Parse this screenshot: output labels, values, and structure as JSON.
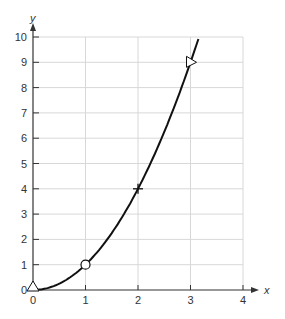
{
  "chart_data": {
    "type": "line",
    "title": "",
    "xlabel": "x",
    "ylabel": "y",
    "xlim": [
      0,
      4
    ],
    "ylim": [
      0,
      10
    ],
    "grid": true,
    "x_ticks": [
      "0",
      "1",
      "2",
      "3",
      "4"
    ],
    "y_ticks": [
      "0",
      "1",
      "2",
      "3",
      "4",
      "5",
      "6",
      "7",
      "8",
      "9",
      "10"
    ],
    "series": [
      {
        "name": "y = x^2",
        "function": "x^2",
        "x": [
          0,
          0.5,
          1,
          1.5,
          2,
          2.5,
          3,
          3.15
        ],
        "values": [
          0,
          0.25,
          1,
          2.25,
          4,
          6.25,
          9,
          9.92
        ]
      }
    ],
    "markers": [
      {
        "x": 0,
        "y": 0,
        "shape": "triangle-up"
      },
      {
        "x": 1,
        "y": 1,
        "shape": "circle"
      },
      {
        "x": 2,
        "y": 4,
        "shape": "plus"
      },
      {
        "x": 3,
        "y": 9,
        "shape": "triangle-left"
      }
    ],
    "colors": {
      "curve": "#111111",
      "grid": "#d8d8d8",
      "axis": "#333333"
    }
  }
}
